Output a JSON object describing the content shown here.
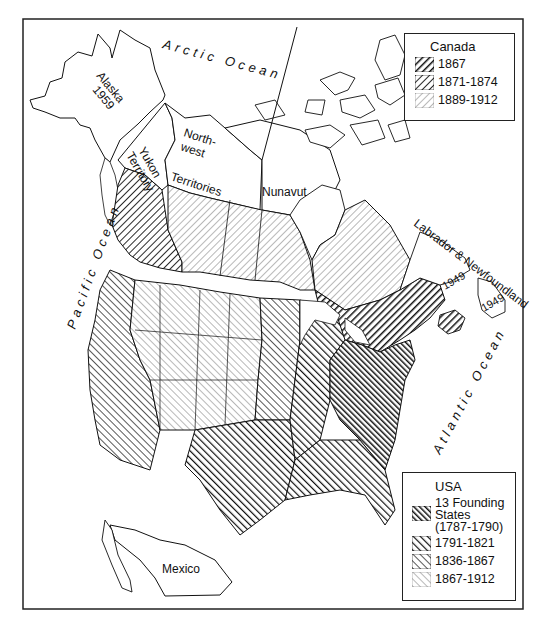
{
  "map": {
    "title": "Territorial expansion of Canada and the USA",
    "oceans": {
      "arctic": "Arctic Ocean",
      "pacific": "Pacific Ocean",
      "atlantic": "Atlantic Ocean"
    },
    "regions": {
      "alaska": "Alaska",
      "alaska_year": "1959",
      "yukon_1": "Yukon",
      "yukon_2": "Territory",
      "nwt_1": "North-",
      "nwt_2": "west",
      "nwt_3": "Territories",
      "nunavut": "Nunavut",
      "labrador": "Labrador & Newfoundland",
      "labrador_year": "1949",
      "newfoundland_year": "1949",
      "mexico": "Mexico"
    }
  },
  "legends": {
    "canada": {
      "title": "Canada",
      "items": [
        {
          "label": "1867",
          "shade": "dark"
        },
        {
          "label": "1871-1874",
          "shade": "medium"
        },
        {
          "label": "1889-1912",
          "shade": "light"
        }
      ]
    },
    "usa": {
      "title": "USA",
      "items": [
        {
          "label": "13 Founding States (1787-1790)",
          "line1": "13 Founding",
          "line2": "States",
          "line3": "(1787-1790)",
          "shade": "darkest"
        },
        {
          "label": "1791-1821",
          "shade": "dark"
        },
        {
          "label": "1836-1867",
          "shade": "medium"
        },
        {
          "label": "1867-1912",
          "shade": "light"
        }
      ]
    }
  },
  "colors": {
    "ink": "#111111",
    "background": "#ffffff"
  }
}
